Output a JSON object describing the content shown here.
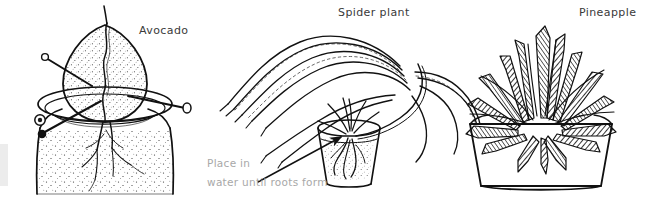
{
  "figure": {
    "kind": "botanical-line-drawing",
    "background_color": "#ffffff",
    "ink_color": "#1a1a1a",
    "caption_color": "#a8a8a8",
    "label_color": "#3a3a3a",
    "topic": "Propagating houseplants from kitchen scraps",
    "panels": [
      {
        "id": "avocado",
        "label": "Avocado",
        "description": "Avocado pit suspended by toothpicks on the rim of a stippled jar of water, with roots growing down into the water"
      },
      {
        "id": "spider-plant",
        "label": "Spider plant",
        "description": "Spider plant with long arching leaves; a plantlet rooting in a glass of water"
      },
      {
        "id": "pineapple",
        "label": "Pineapple",
        "description": "Pineapple crown planted in a tapered pot"
      }
    ],
    "annotation": {
      "line1": "Place in",
      "line2": "water until roots form",
      "arrow": "arrow pointing up-right toward the glass of water"
    }
  }
}
